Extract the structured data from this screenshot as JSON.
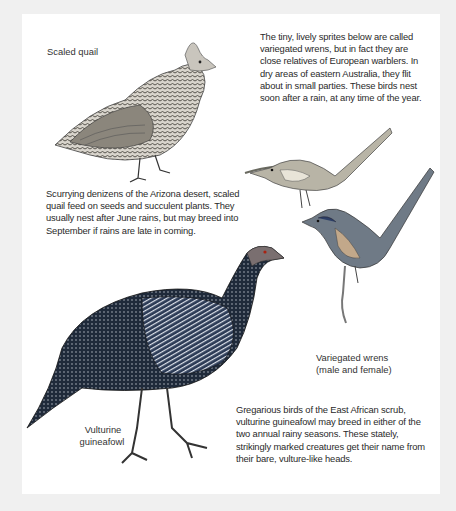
{
  "birds": {
    "scaled_quail": {
      "label": "Scaled quail",
      "description": "Scurrying denizens of the Arizona desert, scaled quail feed on seeds and succulent plants. They usually nest after June rains, but may breed into September if rains are late in coming."
    },
    "variegated_wrens": {
      "intro": "The tiny, lively sprites below are called variegated wrens, but in fact they are close relatives of European warblers. In dry areas of eastern Australia, they flit about in small parties. These birds nest soon after a rain, at any time of the year.",
      "label_line1": "Variegated wrens",
      "label_line2": "(male and female)"
    },
    "vulturine_guineafowl": {
      "label_line1": "Vulturine",
      "label_line2": "guineafowl",
      "description": "Gregarious birds of the East African scrub, vulturine guineafowl may breed in either of the two annual rainy seasons. These stately, strikingly marked creatures get their name from their bare, vulture-like heads."
    }
  },
  "colors": {
    "page": "#ffffff",
    "background": "#f0f0f0",
    "ink": "#2a2a2a"
  }
}
